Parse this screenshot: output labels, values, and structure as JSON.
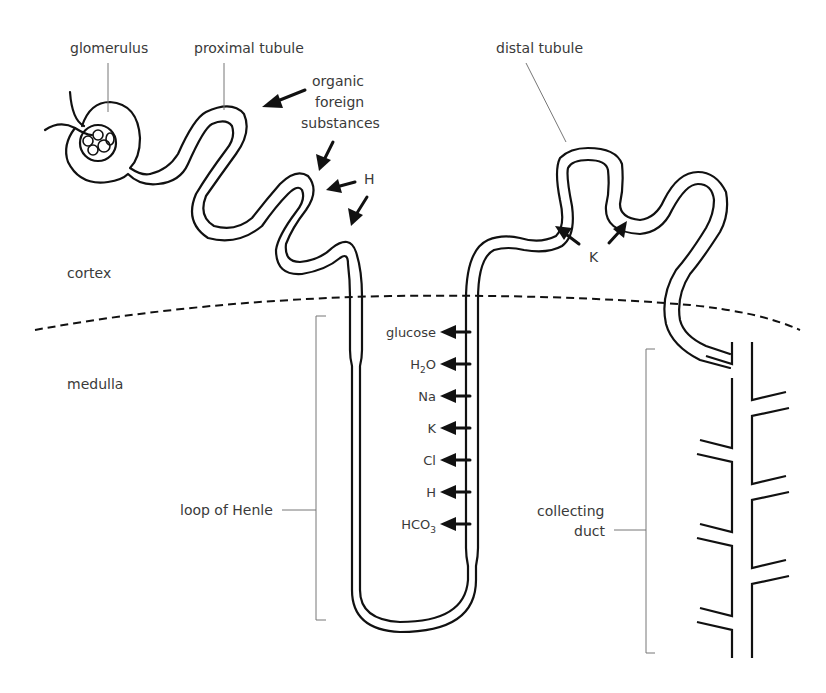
{
  "regions": {
    "cortex": "cortex",
    "medulla": "medulla"
  },
  "structures": {
    "glomerulus": "glomerulus",
    "proximal_tubule": "proximal tubule",
    "distal_tubule": "distal tubule",
    "loop_of_henle": "loop of Henle",
    "collecting_duct_line1": "collecting",
    "collecting_duct_line2": "duct"
  },
  "secretion_proximal": {
    "organic_line1": "organic",
    "organic_line2": "foreign",
    "organic_line3": "substances",
    "h": "H"
  },
  "secretion_distal": {
    "k": "K"
  },
  "reabsorbed": [
    {
      "label": "glucose"
    },
    {
      "label": "H",
      "sub": "2",
      "suffix": "O"
    },
    {
      "label": "Na"
    },
    {
      "label": "K"
    },
    {
      "label": "Cl"
    },
    {
      "label": "H"
    },
    {
      "label": "HCO",
      "sub": "3"
    }
  ],
  "colors": {
    "line": "#111111",
    "label": "#3a3a3a",
    "leader": "#777777",
    "background": "#ffffff"
  }
}
